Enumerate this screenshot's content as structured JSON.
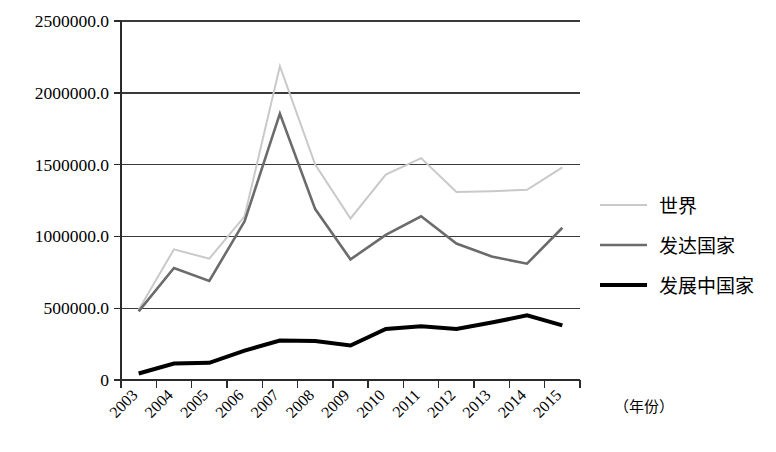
{
  "chart_data": {
    "type": "line",
    "title": "",
    "subtitle": "",
    "xlabel": "（年份）",
    "ylabel": "",
    "grid": true,
    "legend_position": "right",
    "xlim": [
      0,
      13
    ],
    "ylim": [
      0,
      2500000
    ],
    "y_ticks": [
      0,
      500000,
      1000000,
      1500000,
      2000000,
      2500000
    ],
    "y_tick_labels": [
      "0",
      "500000.0",
      "1000000.0",
      "1500000.0",
      "2000000.0",
      "2500000.0"
    ],
    "categories": [
      "2003",
      "2004",
      "2005",
      "2006",
      "2007",
      "2008",
      "2009",
      "2010",
      "2011",
      "2012",
      "2013",
      "2014",
      "2015"
    ],
    "series": [
      {
        "name": "世界",
        "color": "#c9c9c9",
        "width": 2.0,
        "values": [
          490000,
          910000,
          845000,
          1140000,
          2185000,
          1500000,
          1125000,
          1430000,
          1545000,
          1310000,
          1315000,
          1325000,
          1480000
        ]
      },
      {
        "name": "发达国家",
        "color": "#6b6b6b",
        "width": 2.6,
        "values": [
          478000,
          780000,
          690000,
          1105000,
          1855000,
          1190000,
          840000,
          1010000,
          1140000,
          950000,
          860000,
          810000,
          1060000
        ]
      },
      {
        "name": "发展中国家",
        "color": "#000000",
        "width": 4.0,
        "values": [
          45000,
          115000,
          120000,
          205000,
          275000,
          272000,
          240000,
          355000,
          375000,
          355000,
          400000,
          450000,
          380000
        ]
      }
    ]
  },
  "legend": {
    "items": [
      {
        "label": "世界",
        "color": "#c9c9c9",
        "width": 2.0
      },
      {
        "label": "发达国家",
        "color": "#6b6b6b",
        "width": 2.6
      },
      {
        "label": "发展中国家",
        "color": "#000000",
        "width": 4.0
      }
    ]
  },
  "axes": {
    "x_axis_title": "（年份）",
    "y_axis_title": ""
  }
}
